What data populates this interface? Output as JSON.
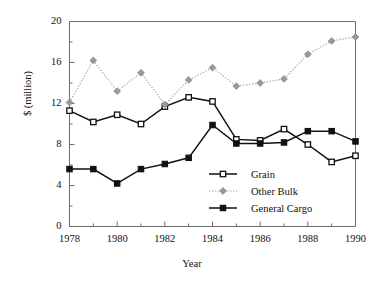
{
  "chart_data": {
    "type": "line",
    "title": "",
    "xlabel": "Year",
    "ylabel": "$ (million)",
    "x": [
      1978,
      1979,
      1980,
      1981,
      1982,
      1983,
      1984,
      1985,
      1986,
      1987,
      1988,
      1989,
      1990
    ],
    "xlim": [
      1978,
      1990
    ],
    "ylim": [
      0,
      20
    ],
    "xticks": [
      1978,
      1980,
      1982,
      1984,
      1986,
      1988,
      1990
    ],
    "xtick_labels": [
      "1978",
      "1980",
      "1982",
      "1984",
      "1986",
      "1988",
      "1990"
    ],
    "xminor_ticks": [
      1979,
      1981,
      1983,
      1985,
      1987,
      1989
    ],
    "yticks": [
      0,
      4,
      8,
      12,
      16,
      20
    ],
    "ytick_labels": [
      "0",
      "4",
      "8",
      "12",
      "16",
      "20"
    ],
    "yminor_ticks": [
      2,
      6,
      10,
      14,
      18
    ],
    "grid": false,
    "legend_position": "inside-lower-right",
    "series": [
      {
        "name": "Grain",
        "marker": "open-square",
        "marker_fill": "#ffffff",
        "color": "#111111",
        "linestyle": "solid",
        "values": [
          11.3,
          10.2,
          10.9,
          10.0,
          11.7,
          12.6,
          12.2,
          8.5,
          8.4,
          9.5,
          8.0,
          6.3,
          6.9
        ]
      },
      {
        "name": "Other Bulk",
        "marker": "diamond",
        "marker_fill": "#9a9a9a",
        "color": "#a6a6a6",
        "linestyle": "dotted",
        "values": [
          12.1,
          16.2,
          13.2,
          15.0,
          11.9,
          14.3,
          15.5,
          13.7,
          14.0,
          14.4,
          16.8,
          18.1,
          18.5
        ]
      },
      {
        "name": "General Cargo",
        "marker": "filled-square",
        "marker_fill": "#111111",
        "color": "#111111",
        "linestyle": "solid",
        "values": [
          5.6,
          5.6,
          4.2,
          5.6,
          6.1,
          6.7,
          9.9,
          8.1,
          8.1,
          8.2,
          9.3,
          9.3,
          8.3
        ]
      }
    ]
  },
  "axes": {
    "ylabel": "$ (million)",
    "xlabel": "Year"
  },
  "legend": {
    "items": [
      {
        "label": "Grain"
      },
      {
        "label": "Other Bulk"
      },
      {
        "label": "General Cargo"
      }
    ]
  },
  "colors": {
    "axis": "#6e6e6e",
    "text": "#111111",
    "grain": "#111111",
    "other_bulk": "#a6a6a6",
    "general_cargo": "#111111"
  }
}
